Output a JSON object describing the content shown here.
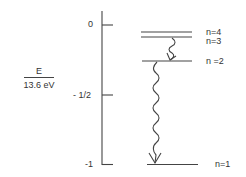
{
  "diagram": {
    "y_axis": {
      "label_numerator": "E",
      "label_denominator": "13.6 eV",
      "ticks": [
        {
          "label": "0",
          "value": 0
        },
        {
          "label": "- 1/2",
          "value": -0.5
        },
        {
          "label": "-1",
          "value": -1
        }
      ]
    },
    "levels": [
      {
        "label": "n=4",
        "n": 4
      },
      {
        "label": "n=3",
        "n": 3
      },
      {
        "label": "n =2",
        "n": 2
      },
      {
        "label": "n=1",
        "n": 1
      }
    ],
    "transitions": [
      {
        "from": 3,
        "to": 2,
        "style": "wavy-arrow"
      },
      {
        "from": 2,
        "to": 1,
        "style": "wavy-arrow"
      }
    ],
    "colors": {
      "line": "#444444",
      "text": "#333333"
    }
  }
}
